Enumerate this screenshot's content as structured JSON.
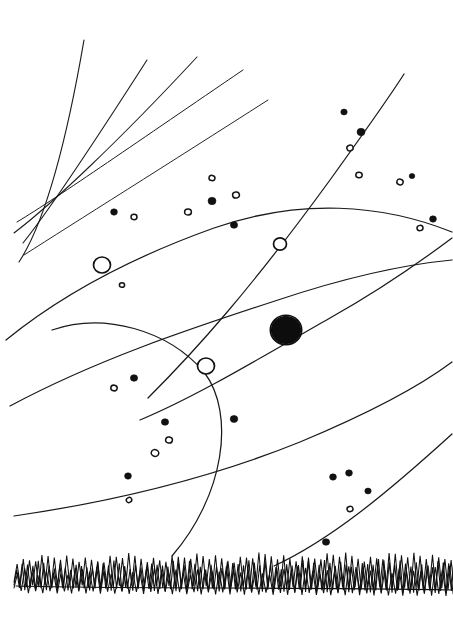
{
  "artwork": {
    "title": "Night Sky with Orbits and Grass Horizon",
    "medium": "hand-drawn ink sketch",
    "background_color": "#ffffff",
    "ink_color": "#111111",
    "width": 453,
    "height": 627
  },
  "scene": {
    "horizon": {
      "name": "grass-horizon",
      "y_top": 560,
      "y_base": 582,
      "spans_full_width": true,
      "style": "dense zigzag scribble"
    },
    "comet_rays": {
      "name": "radiating-rays-upper-left",
      "count": 5,
      "origin_region": "upper-left",
      "rays": [
        {
          "id": "ray-1",
          "d": "M 19 262 C 40 230 62 168 84 40"
        },
        {
          "id": "ray-2",
          "d": "M 23 243 C 48 212 88 152 147 60"
        },
        {
          "id": "ray-3",
          "d": "M 14 233 C 52 204 118 142 197 57"
        },
        {
          "id": "ray-4",
          "d": "M 17 222 C 60 196 140 140 243 70"
        },
        {
          "id": "ray-5",
          "d": "M 24 255 C 74 223 168 164 268 100"
        }
      ]
    },
    "orbits": {
      "name": "orbit-curves",
      "count": 7,
      "curves": [
        {
          "id": "orbit-upper-arc",
          "description": "long flattened arc crossing from left edge to right edge through upper-middle",
          "d": "M 6 340 C 60 296 130 258 214 228 C 300 198 382 204 452 232"
        },
        {
          "id": "orbit-diagonal-a",
          "description": "straight-ish diagonal from lower-left to upper-right through small ring",
          "d": "M 148 398 C 196 350 250 290 330 180 C 366 130 390 96 404 74"
        },
        {
          "id": "orbit-diagonal-b",
          "description": "second diagonal running through the dark planet",
          "d": "M 140 420 C 200 395 270 352 330 318 C 380 290 420 262 452 238"
        },
        {
          "id": "orbit-big-left-circle",
          "description": "large near-circular arc on the left, passing through the small ring and down to the grass",
          "d": "M 52 330 C 104 312 168 330 204 372 C 236 414 224 496 172 556"
        },
        {
          "id": "orbit-mid-left-sweep",
          "description": "broad sweep from left edge arcing right and up to the right edge",
          "d": "M 10 406 C 96 360 186 330 278 300 C 350 276 410 264 452 260"
        },
        {
          "id": "orbit-lower-sweep",
          "description": "low sweeping curve from left edge to right edge",
          "d": "M 14 516 C 110 502 206 480 300 442 C 372 412 420 386 452 362"
        },
        {
          "id": "orbit-lowest-right",
          "description": "short curve rising from the grass on the right",
          "d": "M 274 566 C 330 540 386 494 452 434"
        }
      ]
    },
    "planets": [
      {
        "id": "planet-ring-left",
        "name": "planet-open-circle-left",
        "cx": 102,
        "cy": 265,
        "r": 8.5,
        "style": "open"
      },
      {
        "id": "planet-ring-upper",
        "name": "planet-open-circle-upper",
        "cx": 280,
        "cy": 244,
        "r": 6.5,
        "style": "open"
      },
      {
        "id": "planet-ring-lower",
        "name": "planet-open-circle-lower",
        "cx": 206,
        "cy": 366,
        "r": 8.5,
        "style": "open"
      },
      {
        "id": "planet-dark",
        "name": "planet-filled-dark",
        "cx": 286,
        "cy": 330,
        "r": 14.5,
        "style": "filled-scribble"
      }
    ],
    "stars": [
      {
        "x": 114,
        "y": 212,
        "r": 3.4,
        "kind": "filled"
      },
      {
        "x": 134,
        "y": 217,
        "r": 3.0,
        "kind": "ring"
      },
      {
        "x": 188,
        "y": 212,
        "r": 3.4,
        "kind": "ring"
      },
      {
        "x": 212,
        "y": 178,
        "r": 3.0,
        "kind": "ring"
      },
      {
        "x": 212,
        "y": 201,
        "r": 4.0,
        "kind": "filled"
      },
      {
        "x": 236,
        "y": 195,
        "r": 3.4,
        "kind": "ring"
      },
      {
        "x": 234,
        "y": 225,
        "r": 3.6,
        "kind": "filled"
      },
      {
        "x": 344,
        "y": 112,
        "r": 3.2,
        "kind": "filled"
      },
      {
        "x": 361,
        "y": 132,
        "r": 4.0,
        "kind": "filled"
      },
      {
        "x": 350,
        "y": 148,
        "r": 3.2,
        "kind": "ring"
      },
      {
        "x": 359,
        "y": 175,
        "r": 3.2,
        "kind": "ring"
      },
      {
        "x": 400,
        "y": 182,
        "r": 3.2,
        "kind": "ring"
      },
      {
        "x": 412,
        "y": 176,
        "r": 2.8,
        "kind": "filled"
      },
      {
        "x": 433,
        "y": 219,
        "r": 3.4,
        "kind": "filled"
      },
      {
        "x": 420,
        "y": 228,
        "r": 3.0,
        "kind": "ring"
      },
      {
        "x": 122,
        "y": 285,
        "r": 2.6,
        "kind": "ring"
      },
      {
        "x": 134,
        "y": 378,
        "r": 3.6,
        "kind": "filled"
      },
      {
        "x": 114,
        "y": 388,
        "r": 3.2,
        "kind": "ring"
      },
      {
        "x": 165,
        "y": 422,
        "r": 3.6,
        "kind": "filled"
      },
      {
        "x": 234,
        "y": 419,
        "r": 3.8,
        "kind": "filled"
      },
      {
        "x": 169,
        "y": 440,
        "r": 3.4,
        "kind": "ring"
      },
      {
        "x": 155,
        "y": 453,
        "r": 3.8,
        "kind": "ring"
      },
      {
        "x": 128,
        "y": 476,
        "r": 3.4,
        "kind": "filled"
      },
      {
        "x": 129,
        "y": 500,
        "r": 2.8,
        "kind": "ring"
      },
      {
        "x": 333,
        "y": 477,
        "r": 3.4,
        "kind": "filled"
      },
      {
        "x": 349,
        "y": 473,
        "r": 3.4,
        "kind": "filled"
      },
      {
        "x": 368,
        "y": 491,
        "r": 3.2,
        "kind": "filled"
      },
      {
        "x": 350,
        "y": 509,
        "r": 3.0,
        "kind": "ring"
      },
      {
        "x": 326,
        "y": 542,
        "r": 3.6,
        "kind": "filled"
      }
    ],
    "counts": {
      "stars_total": 29,
      "stars_filled": 14,
      "stars_ring": 15,
      "planets_open": 3,
      "planets_filled": 1,
      "orbit_curves": 7,
      "comet_rays": 5
    }
  }
}
